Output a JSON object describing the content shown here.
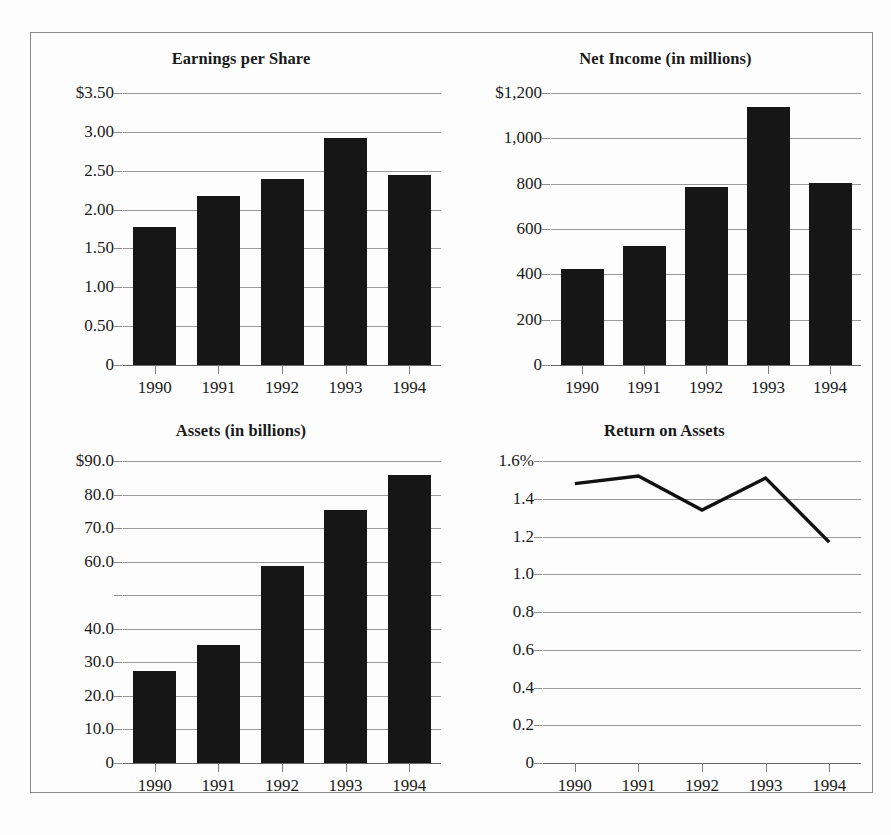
{
  "figure": {
    "panels": [
      "Earnings per Share",
      "Net Income (in millions)",
      "Assets (in billions)",
      "Return on Assets"
    ],
    "frame_color": "#8a8a8a",
    "bar_color": "#161616",
    "grid_color": "#9a9a9a",
    "background": "#fdfdfd"
  },
  "chart_data": [
    {
      "type": "bar",
      "title": "Earnings per Share",
      "categories": [
        "1990",
        "1991",
        "1992",
        "1993",
        "1994"
      ],
      "values": [
        1.77,
        2.17,
        2.4,
        2.92,
        2.45
      ],
      "ytick_labels": [
        "$3.50",
        "3.00",
        "2.50",
        "2.00",
        "1.50",
        "1.00",
        "0.50",
        "0"
      ],
      "ytick_values": [
        3.5,
        3.0,
        2.5,
        2.0,
        1.5,
        1.0,
        0.5,
        0
      ],
      "ylim": [
        0,
        3.5
      ],
      "xlabel": "",
      "ylabel": "",
      "grid": true,
      "legend": "none"
    },
    {
      "type": "bar",
      "title": "Net Income (in millions)",
      "categories": [
        "1990",
        "1991",
        "1992",
        "1993",
        "1994"
      ],
      "values": [
        425,
        525,
        785,
        1140,
        805
      ],
      "ytick_labels": [
        "$1,200",
        "1,000",
        "800",
        "600",
        "400",
        "200",
        "0"
      ],
      "ytick_values": [
        1200,
        1000,
        800,
        600,
        400,
        200,
        0
      ],
      "ylim": [
        0,
        1200
      ],
      "xlabel": "",
      "ylabel": "",
      "grid": true,
      "legend": "none"
    },
    {
      "type": "bar",
      "title": "Assets (in billions)",
      "categories": [
        "1990",
        "1991",
        "1992",
        "1993",
        "1994"
      ],
      "values": [
        27.5,
        35.2,
        58.8,
        75.3,
        85.8
      ],
      "ytick_labels": [
        "$90.0",
        "80.0",
        "70.0",
        "60.0",
        "",
        "40.0",
        "30.0",
        "20.0",
        "10.0",
        "0"
      ],
      "ytick_values": [
        90,
        80,
        70,
        60,
        50,
        40,
        30,
        20,
        10,
        0
      ],
      "ylim": [
        0,
        90
      ],
      "xlabel": "",
      "ylabel": "",
      "grid": true,
      "legend": "none"
    },
    {
      "type": "line",
      "title": "Return on Assets",
      "categories": [
        "1990",
        "1991",
        "1992",
        "1993",
        "1994"
      ],
      "values": [
        1.48,
        1.52,
        1.34,
        1.51,
        1.17
      ],
      "ytick_labels": [
        "1.6%",
        "1.4",
        "1.2",
        "1.0",
        "0.8",
        "0.6",
        "0.4",
        "0.2",
        "0"
      ],
      "ytick_values": [
        1.6,
        1.4,
        1.2,
        1.0,
        0.8,
        0.6,
        0.4,
        0.2,
        0
      ],
      "ylim": [
        0,
        1.6
      ],
      "xlabel": "",
      "ylabel": "",
      "grid": true,
      "legend": "none"
    }
  ]
}
